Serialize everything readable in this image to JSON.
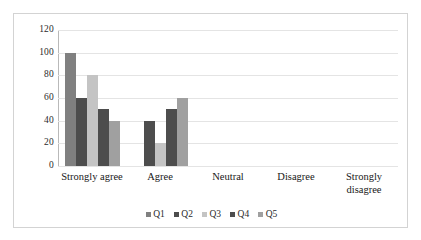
{
  "chart_data": {
    "type": "bar",
    "title": "",
    "xlabel": "",
    "ylabel": "",
    "ylim": [
      0,
      120
    ],
    "yticks": [
      120,
      100,
      80,
      60,
      40,
      20,
      0
    ],
    "grid": true,
    "legend_position": "bottom",
    "categories": [
      "Strongly agree",
      "Agree",
      "Neutral",
      "Disagree",
      "Strongly disagree"
    ],
    "series": [
      {
        "name": "Q1",
        "color": "#808080",
        "values": [
          100,
          0,
          0,
          0,
          0
        ]
      },
      {
        "name": "Q2",
        "color": "#4d4d4d",
        "values": [
          60,
          40,
          0,
          0,
          0
        ]
      },
      {
        "name": "Q3",
        "color": "#c4c4c4",
        "values": [
          80,
          20,
          0,
          0,
          0
        ]
      },
      {
        "name": "Q4",
        "color": "#4d4d4d",
        "values": [
          50,
          50,
          0,
          0,
          0
        ]
      },
      {
        "name": "Q5",
        "color": "#a0a0a0",
        "values": [
          40,
          60,
          0,
          0,
          0
        ]
      }
    ]
  },
  "style": {
    "border_color": "#d3d3d3",
    "grid_color": "#e4e4e4",
    "axis_color": "#b9b9b9",
    "text_color": "#2b2b2b"
  }
}
